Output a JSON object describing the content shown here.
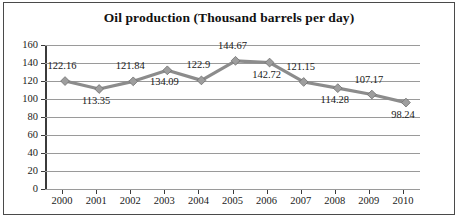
{
  "chart_data": {
    "type": "line",
    "title": "Oil production (Thousand barrels per day)",
    "xlabel": "",
    "ylabel": "",
    "categories": [
      "2000",
      "2001",
      "2002",
      "2003",
      "2004",
      "2005",
      "2006",
      "2007",
      "2008",
      "2009",
      "2010"
    ],
    "values": [
      122.16,
      113.35,
      121.84,
      134.09,
      122.9,
      144.67,
      142.72,
      121.15,
      114.28,
      107.17,
      98.24
    ],
    "point_labels": [
      "122.16",
      "113.35",
      "121.84",
      "134.09",
      "122.9",
      "144.67",
      "142.72",
      "121.15",
      "114.28",
      "107.17",
      "98.24"
    ],
    "ylim": [
      0,
      160
    ],
    "ytick_labels": [
      "160",
      "140",
      "120",
      "100",
      "80",
      "60",
      "40",
      "20",
      "0"
    ],
    "ytick_values": [
      160,
      140,
      120,
      100,
      80,
      60,
      40,
      20,
      0
    ],
    "grid": true,
    "legend": false,
    "series_color": "#8c8c8c",
    "marker": "diamond",
    "marker_color": "#9e9e9e",
    "gridline_color": "#9a9a9a",
    "axis_color": "#3b3b3b",
    "border_color": "#4a4a4a",
    "text_color": "#1a1a1a"
  }
}
